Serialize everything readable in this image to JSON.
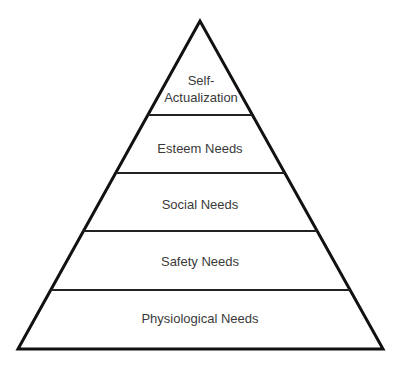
{
  "diagram": {
    "type": "pyramid",
    "levels": [
      {
        "label_line1": "Self-",
        "label_line2": "Actualization"
      },
      {
        "label": "Esteem Needs"
      },
      {
        "label": "Social Needs"
      },
      {
        "label": "Safety Needs"
      },
      {
        "label": "Physiological Needs"
      }
    ],
    "colors": {
      "stroke": "#111111",
      "text": "#3a3a3a",
      "background": "#ffffff"
    }
  }
}
